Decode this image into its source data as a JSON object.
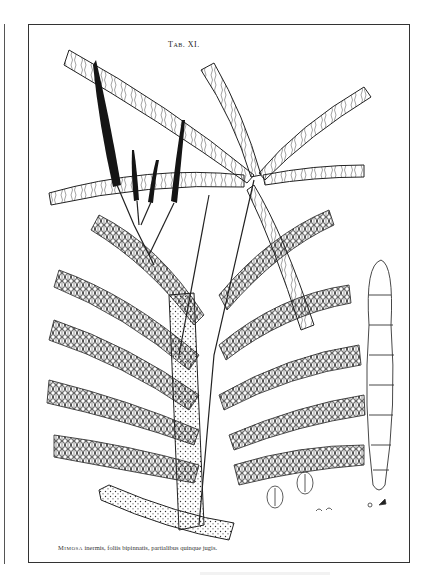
{
  "plate": {
    "title": "Tab. XI.",
    "caption_genus": "Mimosa",
    "caption_text": " inermis, foliis bipinnatis, partialibus quinque jugis."
  },
  "illustration": {
    "subject": "Mimosa branch with bipinnate leaves, flower spikes, seed pods, and seeds",
    "ink_color": "#1a1a1a",
    "paper_color": "#ffffff",
    "frame_color": "#333333"
  }
}
